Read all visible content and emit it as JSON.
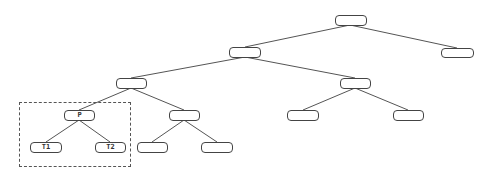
{
  "diagram": {
    "type": "tree",
    "edge_color": "#555555",
    "node_border_color": "#444444",
    "highlight_box": {
      "style": "dashed",
      "contains": [
        "P",
        "T1",
        "T2"
      ]
    },
    "nodes": [
      {
        "id": "n0",
        "label": ""
      },
      {
        "id": "n1",
        "label": ""
      },
      {
        "id": "n2",
        "label": ""
      },
      {
        "id": "n3",
        "label": ""
      },
      {
        "id": "n4",
        "label": ""
      },
      {
        "id": "n5",
        "label": "P"
      },
      {
        "id": "n6",
        "label": ""
      },
      {
        "id": "n7",
        "label": ""
      },
      {
        "id": "n8",
        "label": ""
      },
      {
        "id": "n9",
        "label": "T1"
      },
      {
        "id": "n10",
        "label": "T2"
      },
      {
        "id": "n11",
        "label": ""
      },
      {
        "id": "n12",
        "label": ""
      }
    ],
    "edges": [
      [
        "n0",
        "n1"
      ],
      [
        "n0",
        "n2"
      ],
      [
        "n1",
        "n3"
      ],
      [
        "n1",
        "n4"
      ],
      [
        "n3",
        "n5"
      ],
      [
        "n3",
        "n6"
      ],
      [
        "n4",
        "n7"
      ],
      [
        "n4",
        "n8"
      ],
      [
        "n5",
        "n9"
      ],
      [
        "n5",
        "n10"
      ],
      [
        "n6",
        "n11"
      ],
      [
        "n6",
        "n12"
      ]
    ]
  }
}
